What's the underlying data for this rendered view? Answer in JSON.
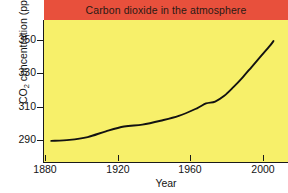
{
  "chart_data": {
    "type": "line",
    "title": "Carbon dioxide in the atmosphere",
    "xlabel": "Year",
    "ylabel": "CO2 concentration (ppm)",
    "ylabel_parts": {
      "prefix": "CO",
      "sub": "2",
      "suffix": " concentration (ppm)"
    },
    "xlim": [
      1876,
      2010
    ],
    "ylim": [
      284,
      358
    ],
    "grid": false,
    "legend": null,
    "xticks": [
      1880,
      1920,
      1960,
      2000
    ],
    "xtick_labels": [
      "1880",
      "1920",
      "1960",
      "2000"
    ],
    "yticks": [
      290,
      310,
      330,
      350
    ],
    "ytick_labels": [
      "290",
      "310",
      "330",
      "350"
    ],
    "series": [
      {
        "name": "CO2 concentration",
        "color": "#121212",
        "x": [
          1880,
          1890,
          1900,
          1910,
          1920,
          1930,
          1940,
          1950,
          1960,
          1965,
          1970,
          1975,
          1980,
          1985,
          1990,
          1995,
          2000,
          2002
        ],
        "y": [
          295.0,
          295.5,
          297.0,
          300.0,
          302.5,
          303.5,
          305.5,
          308.0,
          312.0,
          314.5,
          315.5,
          318.5,
          323.0,
          328.0,
          333.5,
          339.0,
          344.5,
          347.0
        ]
      }
    ],
    "colors": {
      "banner": "#e8503c",
      "plot_background": "#f7f06a",
      "line": "#121212",
      "axis": "#1a1a1a",
      "text": "#141414",
      "title_text": "#2a1a14",
      "page_background": "#ffffff"
    }
  },
  "title": {
    "text": "Carbon dioxide in the atmosphere"
  },
  "axes": {
    "x_title": "Year",
    "y_title_prefix": "CO",
    "y_title_sub": "2",
    "y_title_suffix": " concentration (ppm)",
    "x_labels": [
      "1880",
      "1920",
      "1960",
      "2000"
    ],
    "y_labels": [
      "350",
      "330",
      "310",
      "290"
    ]
  }
}
